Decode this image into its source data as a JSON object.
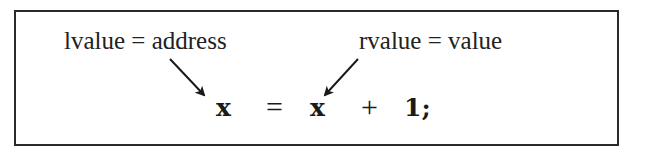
{
  "labels": {
    "lvalue": "lvalue = address",
    "rvalue": "rvalue = value"
  },
  "equation": {
    "lhs": "x",
    "assign": "=",
    "rhs_var": "x",
    "plus": "+",
    "literal": "1;"
  },
  "arrows": [
    {
      "from": "lvalue-label",
      "to": "lhs-x"
    },
    {
      "from": "rvalue-label",
      "to": "rhs-x"
    }
  ]
}
